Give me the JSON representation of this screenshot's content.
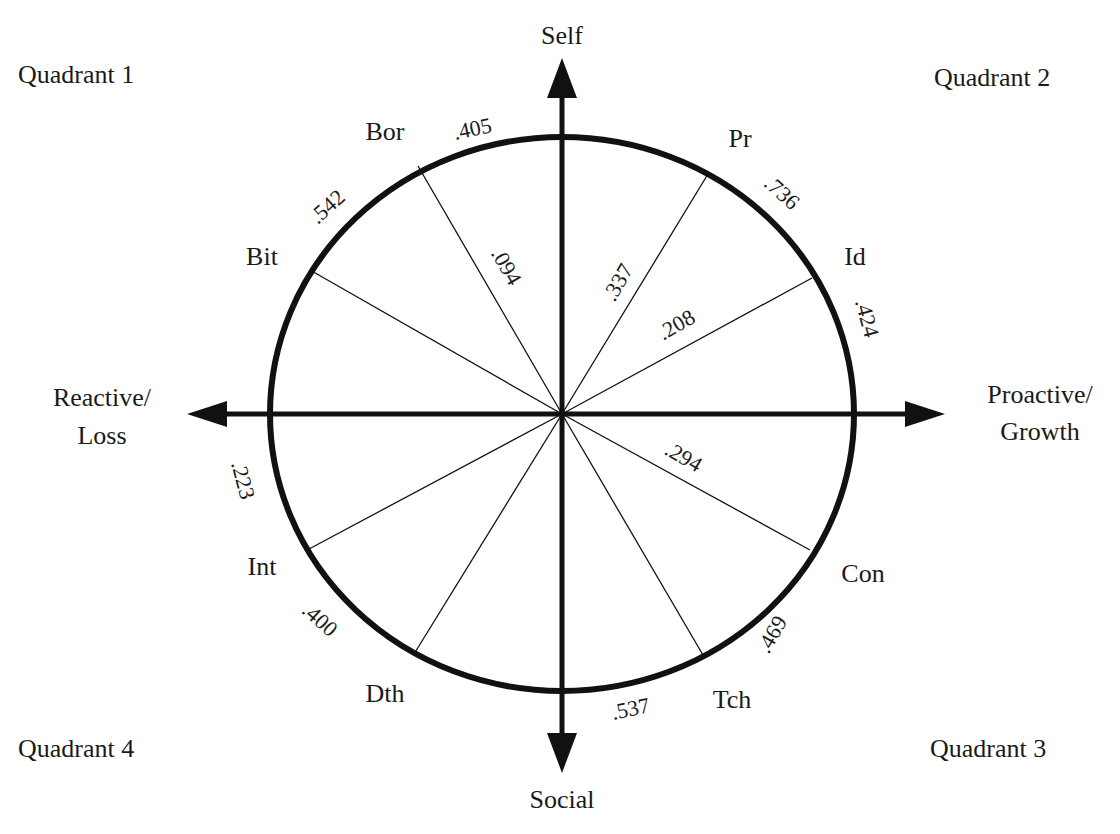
{
  "diagram": {
    "type": "circumplex",
    "colors": {
      "ink": "#111111",
      "background": "#ffffff"
    },
    "axes": {
      "top": "Self",
      "bottom": "Social",
      "left_line1": "Reactive/",
      "left_line2": "Loss",
      "right_line1": "Proactive/",
      "right_line2": "Growth"
    },
    "quadrants": {
      "q1": "Quadrant 1",
      "q2": "Quadrant 2",
      "q3": "Quadrant 3",
      "q4": "Quadrant 4"
    },
    "sector_labels": {
      "bor": "Bor",
      "bit": "Bit",
      "pr": "Pr",
      "id": "Id",
      "con": "Con",
      "tch": "Tch",
      "dth": "Dth",
      "int": "Int"
    },
    "rim_values": {
      "bor_self": ".405",
      "bit_bor": ".542",
      "pr_id": ".736",
      "id_right": ".424",
      "left_int": ".223",
      "int_dth": ".400",
      "social_tch": ".537",
      "tch_con": ".469"
    },
    "spoke_values": {
      "bor": ".094",
      "pr": ".337",
      "id": ".208",
      "con": ".294"
    }
  }
}
